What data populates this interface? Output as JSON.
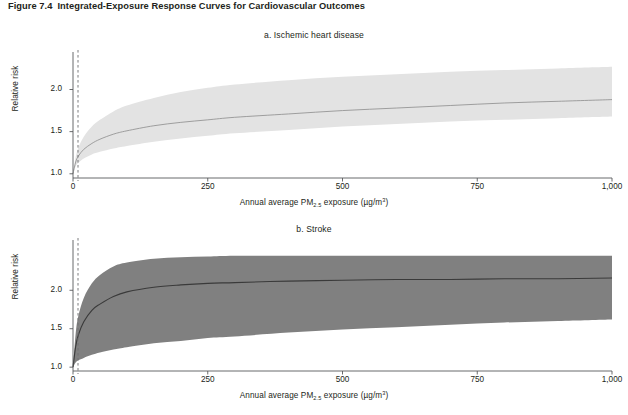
{
  "figure": {
    "number": "Figure 7.4",
    "title": "Integrated-Exposure Response Curves for Cardiovascular Outcomes"
  },
  "panels": [
    {
      "id": "a",
      "title": "a. Ischemic heart disease",
      "ylabel": "Relative risk",
      "xlabel_prefix": "Annual average PM",
      "xlabel_sub": "2.5",
      "xlabel_mid": " exposure (µg/m",
      "xlabel_sup": "3",
      "xlabel_suffix": ")",
      "yticks": [
        "1.0",
        "1.5",
        "2.0"
      ],
      "xticks": [
        "0",
        "250",
        "500",
        "750",
        "1,000"
      ],
      "band_color": "#e3e3e3",
      "line_color": "#8c8c8c"
    },
    {
      "id": "b",
      "title": "b. Stroke",
      "ylabel": "Relative risk",
      "xlabel_prefix": "Annual average PM",
      "xlabel_sub": "2.5",
      "xlabel_mid": " exposure (µg/m",
      "xlabel_sup": "3",
      "xlabel_suffix": ")",
      "yticks": [
        "1.0",
        "1.5",
        "2.0"
      ],
      "xticks": [
        "0",
        "250",
        "500",
        "750",
        "1,000"
      ],
      "band_color": "#808080",
      "line_color": "#3a3a3a"
    }
  ],
  "chart_data": [
    {
      "type": "area",
      "title": "a. Ischemic heart disease",
      "xlabel": "Annual average PM2.5 exposure (µg/m3)",
      "ylabel": "Relative risk",
      "xlim": [
        0,
        1000
      ],
      "ylim": [
        0.95,
        2.35
      ],
      "xticks": [
        0,
        250,
        500,
        750,
        1000
      ],
      "yticks": [
        1.0,
        1.5,
        2.0
      ],
      "grid": false,
      "legend": null,
      "reference_line": {
        "type": "vertical",
        "x": 0,
        "style": "dashed"
      },
      "x": [
        0,
        5,
        10,
        20,
        35,
        50,
        75,
        100,
        150,
        200,
        250,
        300,
        400,
        500,
        600,
        700,
        800,
        900,
        1000
      ],
      "series": [
        {
          "name": "Mean relative risk",
          "values": [
            1.0,
            1.14,
            1.21,
            1.29,
            1.36,
            1.41,
            1.47,
            1.51,
            1.57,
            1.61,
            1.64,
            1.67,
            1.71,
            1.75,
            1.78,
            1.81,
            1.84,
            1.86,
            1.88
          ]
        },
        {
          "name": "Upper 95% confidence bound",
          "values": [
            1.0,
            1.2,
            1.31,
            1.44,
            1.56,
            1.64,
            1.74,
            1.81,
            1.9,
            1.97,
            2.02,
            2.06,
            2.11,
            2.15,
            2.18,
            2.21,
            2.23,
            2.25,
            2.27
          ]
        },
        {
          "name": "Lower 95% confidence bound",
          "values": [
            1.0,
            1.09,
            1.13,
            1.18,
            1.23,
            1.26,
            1.3,
            1.33,
            1.38,
            1.42,
            1.45,
            1.48,
            1.52,
            1.56,
            1.59,
            1.62,
            1.64,
            1.66,
            1.68
          ]
        }
      ]
    },
    {
      "type": "area",
      "title": "b. Stroke",
      "xlabel": "Annual average PM2.5 exposure (µg/m3)",
      "ylabel": "Relative risk",
      "xlim": [
        0,
        1000
      ],
      "ylim": [
        0.95,
        2.55
      ],
      "xticks": [
        0,
        250,
        500,
        750,
        1000
      ],
      "yticks": [
        1.0,
        1.5,
        2.0
      ],
      "grid": false,
      "legend": null,
      "reference_line": {
        "type": "vertical",
        "x": 0,
        "style": "dashed"
      },
      "x": [
        0,
        5,
        10,
        20,
        35,
        50,
        75,
        100,
        150,
        200,
        250,
        300,
        400,
        500,
        600,
        700,
        800,
        900,
        1000
      ],
      "series": [
        {
          "name": "Mean relative risk",
          "values": [
            1.0,
            1.27,
            1.42,
            1.59,
            1.74,
            1.82,
            1.92,
            1.98,
            2.04,
            2.07,
            2.09,
            2.1,
            2.12,
            2.13,
            2.14,
            2.14,
            2.15,
            2.15,
            2.16
          ]
        },
        {
          "name": "Upper 95% confidence bound",
          "values": [
            1.0,
            1.44,
            1.67,
            1.9,
            2.09,
            2.2,
            2.31,
            2.36,
            2.41,
            2.43,
            2.44,
            2.45,
            2.45,
            2.45,
            2.45,
            2.45,
            2.45,
            2.45,
            2.45
          ]
        },
        {
          "name": "Lower 95% confidence bound",
          "values": [
            1.0,
            1.06,
            1.09,
            1.12,
            1.16,
            1.19,
            1.23,
            1.26,
            1.31,
            1.34,
            1.38,
            1.4,
            1.45,
            1.49,
            1.52,
            1.55,
            1.58,
            1.6,
            1.62
          ]
        }
      ]
    }
  ]
}
